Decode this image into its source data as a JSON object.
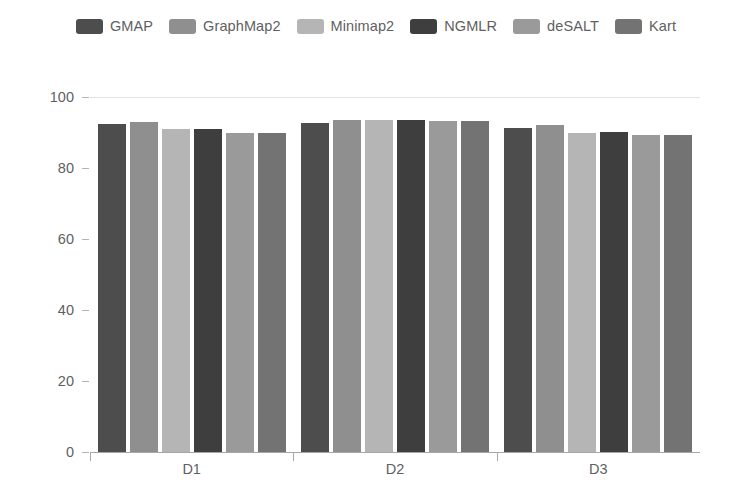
{
  "chart_data": {
    "type": "bar",
    "title": "",
    "subtitle": "",
    "xlabel": "",
    "ylabel": "",
    "categories": [
      "D1",
      "D2",
      "D3"
    ],
    "series": [
      {
        "name": "GMAP",
        "color": "#4d4d4d",
        "values": [
          92.4,
          92.6,
          91.4
        ]
      },
      {
        "name": "GraphMap2",
        "color": "#8f8f8f",
        "values": [
          93.0,
          93.4,
          92.0
        ]
      },
      {
        "name": "Minimap2",
        "color": "#b5b5b5",
        "values": [
          91.0,
          93.6,
          90.0
        ]
      },
      {
        "name": "NGMLR",
        "color": "#3e3e3e",
        "values": [
          91.0,
          93.6,
          90.2
        ]
      },
      {
        "name": "deSALT",
        "color": "#9a9a9a",
        "values": [
          90.0,
          93.2,
          89.4
        ]
      },
      {
        "name": "Kart",
        "color": "#737373",
        "values": [
          90.0,
          93.2,
          89.4
        ]
      }
    ],
    "ylim": [
      0,
      100
    ],
    "yticks": [
      0,
      20,
      40,
      60,
      80,
      100
    ],
    "ytick_labels": [
      "0",
      "20",
      "40",
      "60",
      "80",
      "100"
    ],
    "grid": "y-only-top",
    "legend_position": "top-center",
    "background_color": "#ffffff",
    "axis_color": "#a8a8a8",
    "text_color": "#5f5f5f"
  }
}
